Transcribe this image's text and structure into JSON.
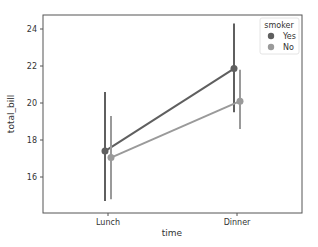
{
  "chart_data": {
    "type": "line",
    "title": "",
    "xlabel": "time",
    "ylabel": "total_bill",
    "categories": [
      "Lunch",
      "Dinner"
    ],
    "yticks": [
      16,
      18,
      20,
      22,
      24
    ],
    "ylim": [
      14.2,
      24.8
    ],
    "legend": {
      "title": "smoker",
      "position": "upper right"
    },
    "series": [
      {
        "name": "Yes",
        "color": "#5f5f5f",
        "values": [
          17.4,
          21.86
        ],
        "ci": [
          [
            14.7,
            20.6
          ],
          [
            19.5,
            24.3
          ]
        ]
      },
      {
        "name": "No",
        "color": "#9a9a9a",
        "values": [
          17.05,
          20.1
        ],
        "ci": [
          [
            14.8,
            19.3
          ],
          [
            18.6,
            21.8
          ]
        ]
      }
    ]
  }
}
